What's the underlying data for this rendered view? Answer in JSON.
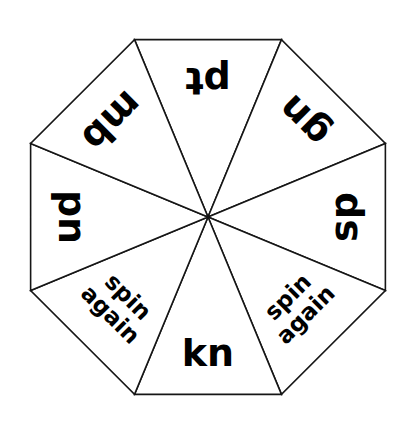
{
  "spinner": {
    "name": "octagon-word-spinner",
    "shape": "octagon",
    "sector_count": 8,
    "center": {
      "x": 208,
      "y": 217
    },
    "radius": 192,
    "colors": {
      "face": "#ffffff",
      "outline": "#161616",
      "text": "#000000",
      "background": "#ffffff"
    },
    "sectors": [
      {
        "id": "sector-pt",
        "label": "pt",
        "lines": [
          "pt"
        ],
        "position": "top",
        "text_rotation_deg": 180,
        "style": "pair"
      },
      {
        "id": "sector-gn",
        "label": "gn",
        "lines": [
          "gn"
        ],
        "position": "top-right",
        "text_rotation_deg": 225,
        "style": "pair"
      },
      {
        "id": "sector-sp",
        "label": "sp",
        "lines": [
          "sp"
        ],
        "position": "right",
        "text_rotation_deg": 270,
        "style": "pair"
      },
      {
        "id": "sector-spin-again-right",
        "label": "spin again",
        "lines": [
          "spin",
          "again"
        ],
        "position": "bottom-right",
        "text_rotation_deg": 315,
        "style": "phrase"
      },
      {
        "id": "sector-kn",
        "label": "kn",
        "lines": [
          "kn"
        ],
        "position": "bottom",
        "text_rotation_deg": 0,
        "style": "pair"
      },
      {
        "id": "sector-spin-again-left",
        "label": "spin again",
        "lines": [
          "spin",
          "again"
        ],
        "position": "bottom-left",
        "text_rotation_deg": 45,
        "style": "phrase"
      },
      {
        "id": "sector-pn",
        "label": "pn",
        "lines": [
          "pn"
        ],
        "position": "left",
        "text_rotation_deg": 90,
        "style": "pair"
      },
      {
        "id": "sector-mb",
        "label": "mb",
        "lines": [
          "mb"
        ],
        "position": "top-left",
        "text_rotation_deg": 135,
        "style": "pair"
      }
    ]
  }
}
